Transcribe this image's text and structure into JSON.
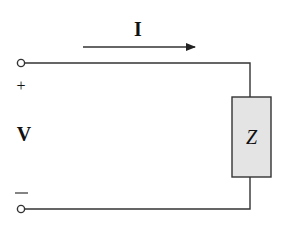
{
  "diagram": {
    "type": "circuit",
    "current_label": "I",
    "voltage_label": "V",
    "plus_sign": "+",
    "minus_sign": "—",
    "load_label": "Z",
    "colors": {
      "wire": "#333333",
      "load_fill": "#e4e4e4",
      "load_stroke": "#333333",
      "text": "#111111"
    }
  }
}
